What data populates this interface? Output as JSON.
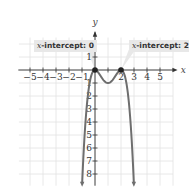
{
  "chart_data": {
    "type": "line",
    "title": "",
    "function": "f(x) = -x^2 (x - 2)^2",
    "xlabel": "x",
    "ylabel": "y",
    "xlim": [
      -6,
      6
    ],
    "ylim": [
      -8.5,
      2.5
    ],
    "x_ticks": [
      -5,
      -4,
      -3,
      -2,
      -1,
      1,
      2,
      3,
      4,
      5
    ],
    "x_tick_labels": [
      "−5",
      "−4",
      "−3",
      "−2",
      "−1",
      "",
      "2",
      "3",
      "4",
      "5"
    ],
    "y_ticks": [
      1,
      -1,
      -2,
      -3,
      -4,
      -5,
      -6,
      -7,
      -8
    ],
    "y_tick_labels": [
      "1",
      "1",
      "2",
      "3",
      "4",
      "5",
      "6",
      "7",
      "8"
    ],
    "grid": true,
    "series": [
      {
        "name": "f(x)",
        "x": [
          -0.9,
          -0.75,
          -0.5,
          -0.25,
          0,
          0.25,
          0.5,
          0.75,
          1,
          1.25,
          1.5,
          1.75,
          2,
          2.25,
          2.5,
          2.75,
          2.9
        ],
        "y": [
          -6.56,
          -4.25,
          -1.56,
          -0.32,
          0,
          -0.19,
          -0.56,
          -0.88,
          -1,
          -0.88,
          -0.56,
          -0.19,
          0,
          -0.32,
          -1.56,
          -4.25,
          -6.56
        ]
      }
    ],
    "points": [
      {
        "x": 0,
        "y": 0,
        "label": "x-intercept: 0"
      },
      {
        "x": 2,
        "y": 0,
        "label": "x-intercept: 2"
      }
    ],
    "annotations": [
      {
        "text_var": "x",
        "text_rest": "-intercept: 0",
        "points_to": [
          0,
          0
        ]
      },
      {
        "text_var": "x",
        "text_rest": "-intercept: 2",
        "points_to": [
          2,
          0
        ]
      }
    ],
    "colors": {
      "curve": "#6e6e6e",
      "axis": "#333333",
      "grid": "#e2e2e2",
      "callout_bg": "#e8e8e8",
      "point": "#222222"
    }
  }
}
